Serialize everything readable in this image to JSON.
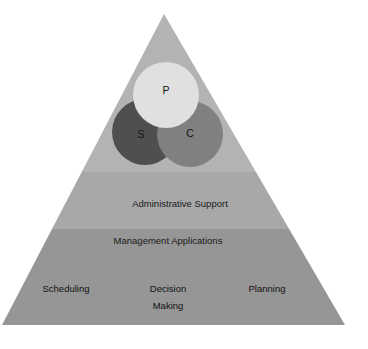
{
  "diagram": {
    "type": "pyramid",
    "shape": {
      "apex": {
        "x": 164,
        "y": 14
      },
      "base_left": {
        "x": 2,
        "y": 325
      },
      "base_right": {
        "x": 345,
        "y": 325
      },
      "tier_boundaries_y": [
        172,
        229
      ]
    },
    "background_color": "#ffffff"
  },
  "tiers": [
    {
      "name": "top-tier",
      "label": "",
      "color": "#b3b3b3",
      "contains": "venn-circles"
    },
    {
      "name": "middle-tier",
      "label": "Administrative Support",
      "color": "#a8a8a8",
      "label_x": 180,
      "label_y": 204
    },
    {
      "name": "bottom-tier",
      "label": "Management Applications",
      "color": "#969696",
      "label_x": 168,
      "label_y": 241
    }
  ],
  "venn": {
    "circles": [
      {
        "id": "p",
        "label": "P",
        "color": "#e0e0e0",
        "cx": 166,
        "cy": 95,
        "r": 33,
        "label_x": 166,
        "label_y": 91
      },
      {
        "id": "s",
        "label": "S",
        "color": "#4f4f4f",
        "cx": 145,
        "cy": 132,
        "r": 33,
        "label_x": 141,
        "label_y": 135
      },
      {
        "id": "c",
        "label": "C",
        "color": "#808080",
        "cx": 190,
        "cy": 134,
        "r": 33,
        "label_x": 190,
        "label_y": 134
      }
    ]
  },
  "base_items": [
    {
      "name": "scheduling",
      "label": "Scheduling",
      "x": 66,
      "y": 289
    },
    {
      "name": "decision-making-line1",
      "label": "Decision",
      "x": 168,
      "y": 289
    },
    {
      "name": "decision-making-line2",
      "label": "Making",
      "x": 168,
      "y": 306
    },
    {
      "name": "planning",
      "label": "Planning",
      "x": 267,
      "y": 289
    }
  ]
}
